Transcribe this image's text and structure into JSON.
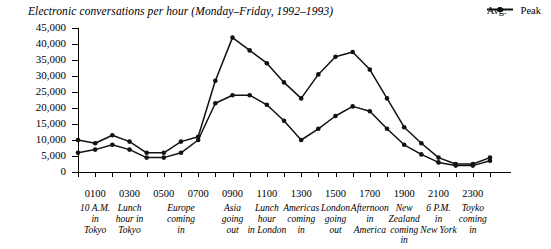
{
  "chart_data": {
    "type": "line",
    "title": "Electronic conversations per hour (Monday–Friday, 1992–1993)",
    "xlabel": "",
    "ylabel": "",
    "ylim": [
      0,
      45000
    ],
    "ytick_labels": [
      "45,000",
      "40,000",
      "35,000",
      "30,000",
      "25,000",
      "20,000",
      "15,000",
      "10,000",
      "5,000",
      "0"
    ],
    "ytick_values": [
      45000,
      40000,
      35000,
      30000,
      25000,
      20000,
      15000,
      10000,
      5000,
      0
    ],
    "grid": false,
    "legend_position": "top-right",
    "x": [
      0,
      1,
      2,
      3,
      4,
      5,
      6,
      7,
      8,
      9,
      10,
      11,
      12,
      13,
      14,
      15,
      16,
      17,
      18,
      19,
      20,
      21,
      22,
      23,
      24
    ],
    "xtick_labels": [
      "0100",
      "0300",
      "0500",
      "0700",
      "0900",
      "1100",
      "1300",
      "1500",
      "1700",
      "1900",
      "2100",
      "2300"
    ],
    "xtick_hours": [
      1,
      3,
      5,
      7,
      9,
      11,
      13,
      15,
      17,
      19,
      21,
      23
    ],
    "annotations": [
      {
        "hour": 1,
        "text": "10 A.M.\nin\nTokyo"
      },
      {
        "hour": 3,
        "text": "Lunch\nhour in\nTokyo"
      },
      {
        "hour": 6,
        "text": "Europe\ncoming\nin"
      },
      {
        "hour": 9,
        "text": "Asia\ngoing\nout"
      },
      {
        "hour": 11,
        "text": "Lunch\nhour\nin London"
      },
      {
        "hour": 13,
        "text": "Americas\ncoming\nin"
      },
      {
        "hour": 15,
        "text": "London\ngoing\nout"
      },
      {
        "hour": 17,
        "text": "Afternoon\nin\nAmerica"
      },
      {
        "hour": 19,
        "text": "New Zealand\ncoming\nin"
      },
      {
        "hour": 21,
        "text": "6 P.M.\nin\nNew York"
      },
      {
        "hour": 23,
        "text": "Toyko\ncoming\nin"
      }
    ],
    "series": [
      {
        "name": "Avg.",
        "color": "#111111",
        "values": [
          6000,
          7000,
          8500,
          7000,
          4500,
          4500,
          6000,
          10000,
          21500,
          24000,
          24000,
          21000,
          16000,
          10000,
          13500,
          17500,
          20500,
          19000,
          13500,
          8500,
          5500,
          3000,
          2000,
          2000,
          3500
        ]
      },
      {
        "name": "Peak",
        "color": "#111111",
        "values": [
          10000,
          9000,
          11500,
          9500,
          6000,
          6000,
          9500,
          11000,
          28500,
          42000,
          38000,
          34000,
          28000,
          23000,
          30500,
          36000,
          37500,
          32000,
          23000,
          14000,
          9000,
          4500,
          2500,
          2500,
          4500
        ]
      }
    ]
  },
  "legend": {
    "items": [
      {
        "label": "Avg."
      },
      {
        "label": "Peak"
      }
    ]
  }
}
